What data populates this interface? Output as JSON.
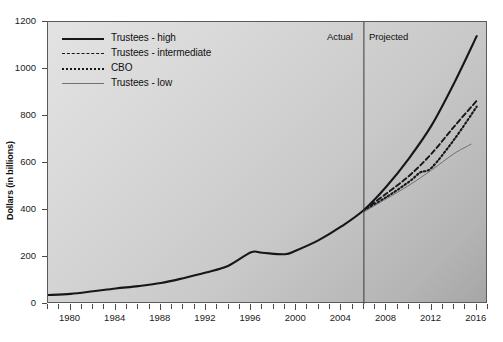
{
  "chart_data": {
    "type": "line",
    "title": "",
    "subtitle": "",
    "xlabel": "",
    "ylabel": "Dollars (in billions)",
    "xlim": [
      1978,
      2017
    ],
    "ylim": [
      0,
      1200
    ],
    "y_ticks": [
      0,
      200,
      400,
      600,
      800,
      1000,
      1200
    ],
    "x_ticks": [
      1980,
      1984,
      1988,
      1992,
      1996,
      2000,
      2004,
      2008,
      2012,
      2016
    ],
    "x_minor_tick_interval": 1,
    "grid": false,
    "legend_position": "top-left",
    "annotations": [
      {
        "text": "Actual",
        "x": 2004.2,
        "y": 1160,
        "type": "region-label"
      },
      {
        "text": "Projected",
        "x": 2006.6,
        "y": 1160,
        "type": "region-label"
      },
      {
        "text": "",
        "x": 2006,
        "type": "vertical-divider"
      }
    ],
    "divider_year": 2006,
    "series": [
      {
        "name": "Trustees - high",
        "style": "solid-thick",
        "color": "#17171a",
        "x": [
          1978,
          1980,
          1982,
          1984,
          1986,
          1988,
          1990,
          1992,
          1994,
          1996,
          1997,
          1999,
          2000,
          2002,
          2004,
          2006,
          2008,
          2010,
          2012,
          2014,
          2016
        ],
        "y": [
          38,
          43,
          54,
          66,
          76,
          89,
          110,
          134,
          163,
          220,
          218,
          212,
          228,
          272,
          330,
          400,
          500,
          620,
          760,
          940,
          1140
        ]
      },
      {
        "name": "Trustees - intermediate",
        "style": "dashed",
        "color": "#17171a",
        "x": [
          2006,
          2008,
          2010,
          2012,
          2014,
          2016
        ],
        "y": [
          400,
          470,
          545,
          640,
          755,
          865
        ]
      },
      {
        "name": "CBO",
        "style": "dotted",
        "color": "#17171a",
        "x": [
          2006,
          2008,
          2010,
          2011,
          2012,
          2014,
          2016
        ],
        "y": [
          398,
          455,
          520,
          560,
          580,
          700,
          840
        ]
      },
      {
        "name": "Trustees - low",
        "style": "solid-thin",
        "color": "#70707a",
        "x": [
          2006,
          2008,
          2010,
          2012,
          2014,
          2015.5
        ],
        "y": [
          392,
          448,
          505,
          570,
          640,
          680
        ]
      }
    ],
    "historical_range": {
      "start": 1978,
      "end": 2006
    },
    "projection_range": {
      "start": 2006,
      "end": 2016
    }
  },
  "legend": {
    "items": [
      {
        "label": "Trustees - high",
        "swatch": "solid-thick"
      },
      {
        "label": "Trustees - intermediate",
        "swatch": "dashed"
      },
      {
        "label": "CBO",
        "swatch": "dotted"
      },
      {
        "label": "Trustees - low",
        "swatch": "solid-thin"
      }
    ]
  },
  "annotations": {
    "actual": "Actual",
    "projected": "Projected"
  },
  "colors": {
    "line_primary": "#17171a",
    "line_light": "#70707a",
    "frame": "#5a5a5a",
    "text": "#111111",
    "plot_bg_light": "#e3e3e3",
    "plot_bg_dark": "#a6a6a6"
  }
}
